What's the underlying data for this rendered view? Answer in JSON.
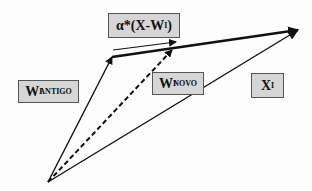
{
  "diagram": {
    "type": "vector-update-diagram",
    "labels": {
      "update_term": {
        "prefix": "α*(X-W",
        "subscript": "I",
        "suffix": ")"
      },
      "w_old": {
        "base": "W",
        "subscript": "I",
        "superscript": "ANTIGO"
      },
      "w_new": {
        "base": "W",
        "subscript": "I",
        "superscript": "NOVO"
      },
      "x_input": {
        "base": "X",
        "subscript": "I"
      }
    },
    "colors": {
      "box_fill": "#d6d6d6",
      "box_border": "#555555",
      "arrow": "#111111",
      "background": "#fdfdfd"
    },
    "vectors": [
      {
        "name": "w-old-vector",
        "from": [
          48,
          182
        ],
        "to": [
          112,
          57
        ],
        "style": "solid"
      },
      {
        "name": "w-new-vector",
        "from": [
          48,
          182
        ],
        "to": [
          172,
          50
        ],
        "style": "dashed"
      },
      {
        "name": "x-vector",
        "from": [
          48,
          182
        ],
        "to": [
          298,
          30
        ],
        "style": "solid"
      },
      {
        "name": "difference-vector",
        "from": [
          112,
          57
        ],
        "to": [
          298,
          30
        ],
        "style": "bold"
      },
      {
        "name": "update-step-vector",
        "from": [
          113,
          50
        ],
        "to": [
          176,
          42
        ],
        "style": "thin"
      }
    ]
  }
}
